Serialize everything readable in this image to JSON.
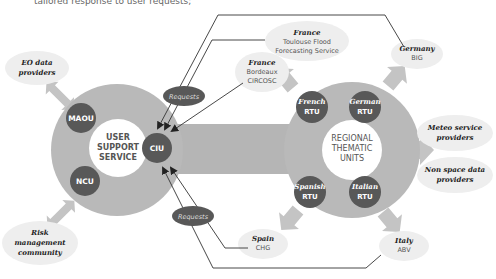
{
  "top_caption": "tailored response to user requests;",
  "colors": {
    "background": "#ffffff",
    "ring_gray": "#b9b9b9",
    "band_gray": "#b5b5b5",
    "arrow_gray": "#c4c4c4",
    "unit_dark": "#585858",
    "label_bubble": "#eeeeee",
    "line": "#3a3a3a",
    "center_text": "#555555"
  },
  "user_support": {
    "center_label": [
      "USER",
      "SUPPORT",
      "SERVICE"
    ],
    "units": [
      {
        "id": "maou",
        "label": "MAOU"
      },
      {
        "id": "ncu",
        "label": "NCU"
      },
      {
        "id": "ciu",
        "label": "CIU"
      }
    ]
  },
  "regional": {
    "center_label": [
      "REGIONAL",
      "THEMATIC",
      "UNITS"
    ],
    "units": [
      {
        "id": "french",
        "line1": "French",
        "line2": "RTU"
      },
      {
        "id": "german",
        "line1": "German",
        "line2": "RTU"
      },
      {
        "id": "spanish",
        "line1": "Spanish",
        "line2": "RTU"
      },
      {
        "id": "italian",
        "line1": "Italian",
        "line2": "RTU"
      }
    ]
  },
  "requests": {
    "top": "Requests",
    "bottom": "Requests"
  },
  "external": {
    "eo": [
      "EO data",
      "providers"
    ],
    "risk": [
      "Risk",
      "management",
      "community"
    ],
    "meteo": [
      "Meteo service",
      "providers"
    ],
    "nonspace": [
      "Non space data",
      "providers"
    ]
  },
  "partners": {
    "france_toulouse": {
      "country": "France",
      "lines": [
        "Toulouse Flood",
        "Forecasting Service"
      ]
    },
    "france_bordeaux": {
      "country": "France",
      "lines": [
        "Bordeaux",
        "CIRCOSC"
      ]
    },
    "germany": {
      "country": "Germany",
      "lines": [
        "BIG"
      ]
    },
    "spain": {
      "country": "Spain",
      "lines": [
        "CHG"
      ]
    },
    "italy": {
      "country": "Italy",
      "lines": [
        "ABV"
      ]
    }
  }
}
